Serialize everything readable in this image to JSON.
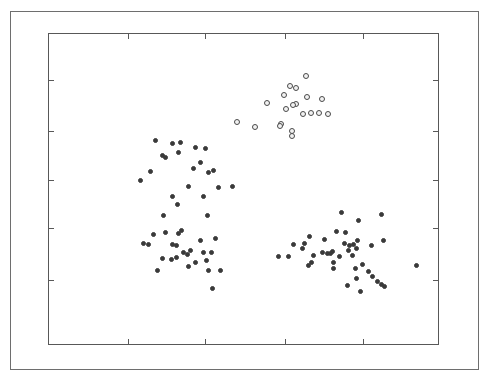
{
  "figure": {
    "width": 490,
    "height": 382,
    "background": "#ffffff",
    "outer_border": {
      "x": 10,
      "y": 11,
      "width": 469,
      "height": 359,
      "color": "#6e6e6e"
    },
    "plot_box": {
      "x": 48,
      "y": 33,
      "width": 391,
      "height": 312,
      "color": "#585858"
    }
  },
  "chart_data": {
    "type": "scatter",
    "title": "",
    "xlabel": "",
    "ylabel": "",
    "grid": false,
    "legend": "none",
    "xlim": [
      0,
      1
    ],
    "ylim": [
      0,
      1
    ],
    "xtick_labels": [],
    "ytick_labels": [],
    "tick_direction": "in",
    "xticks_px": [
      128,
      205,
      285,
      363
    ],
    "yticks_px": [
      80,
      131,
      180,
      228,
      280
    ],
    "marker_colors": {
      "filled": "#3a3a3a",
      "open_edge": "#4a4a4a",
      "open_face": "#f2f2f2"
    },
    "series": [
      {
        "name": "cluster-upper-left",
        "marker": "filled",
        "points_px": [
          [
            155,
            140
          ],
          [
            172,
            143
          ],
          [
            180,
            142
          ],
          [
            162,
            155
          ],
          [
            165,
            157
          ],
          [
            140,
            180
          ],
          [
            178,
            152
          ],
          [
            195,
            147
          ],
          [
            205,
            148
          ],
          [
            200,
            162
          ],
          [
            208,
            172
          ],
          [
            213,
            170
          ],
          [
            188,
            186
          ],
          [
            218,
            187
          ],
          [
            203,
            196
          ],
          [
            172,
            196
          ],
          [
            177,
            204
          ],
          [
            207,
            215
          ],
          [
            163,
            215
          ],
          [
            232,
            186
          ],
          [
            150,
            171
          ],
          [
            193,
            168
          ]
        ]
      },
      {
        "name": "cluster-upper-middle-open",
        "marker": "open",
        "points_px": [
          [
            306,
            76
          ],
          [
            290,
            86
          ],
          [
            296,
            88
          ],
          [
            284,
            95
          ],
          [
            307,
            97
          ],
          [
            296,
            104
          ],
          [
            293,
            105
          ],
          [
            286,
            109
          ],
          [
            322,
            99
          ],
          [
            303,
            114
          ],
          [
            311,
            113
          ],
          [
            319,
            113
          ],
          [
            328,
            114
          ],
          [
            267,
            103
          ],
          [
            237,
            122
          ],
          [
            281,
            124
          ],
          [
            280,
            126
          ],
          [
            292,
            131
          ],
          [
            292,
            136
          ],
          [
            255,
            127
          ]
        ]
      },
      {
        "name": "cluster-lower-left",
        "marker": "filled",
        "points_px": [
          [
            153,
            234
          ],
          [
            143,
            243
          ],
          [
            148,
            244
          ],
          [
            165,
            232
          ],
          [
            178,
            233
          ],
          [
            181,
            230
          ],
          [
            172,
            244
          ],
          [
            176,
            245
          ],
          [
            183,
            252
          ],
          [
            187,
            254
          ],
          [
            190,
            250
          ],
          [
            162,
            258
          ],
          [
            171,
            259
          ],
          [
            176,
            257
          ],
          [
            203,
            252
          ],
          [
            211,
            252
          ],
          [
            200,
            240
          ],
          [
            215,
            238
          ],
          [
            208,
            270
          ],
          [
            220,
            270
          ],
          [
            212,
            288
          ],
          [
            206,
            260
          ],
          [
            195,
            262
          ],
          [
            157,
            270
          ],
          [
            188,
            266
          ]
        ]
      },
      {
        "name": "cluster-lower-right",
        "marker": "filled",
        "points_px": [
          [
            341,
            212
          ],
          [
            358,
            220
          ],
          [
            381,
            214
          ],
          [
            345,
            232
          ],
          [
            357,
            240
          ],
          [
            336,
            231
          ],
          [
            344,
            243
          ],
          [
            349,
            245
          ],
          [
            353,
            244
          ],
          [
            356,
            248
          ],
          [
            293,
            244
          ],
          [
            302,
            248
          ],
          [
            304,
            243
          ],
          [
            322,
            252
          ],
          [
            327,
            253
          ],
          [
            332,
            251
          ],
          [
            339,
            256
          ],
          [
            309,
            236
          ],
          [
            313,
            255
          ],
          [
            324,
            239
          ],
          [
            371,
            245
          ],
          [
            383,
            240
          ],
          [
            333,
            268
          ],
          [
            355,
            268
          ],
          [
            362,
            264
          ],
          [
            368,
            271
          ],
          [
            372,
            276
          ],
          [
            377,
            281
          ],
          [
            381,
            284
          ],
          [
            384,
            286
          ],
          [
            356,
            278
          ],
          [
            347,
            285
          ],
          [
            360,
            291
          ],
          [
            330,
            253
          ],
          [
            333,
            262
          ],
          [
            278,
            256
          ],
          [
            308,
            265
          ],
          [
            311,
            262
          ],
          [
            288,
            256
          ],
          [
            416,
            265
          ],
          [
            352,
            255
          ],
          [
            348,
            250
          ]
        ]
      }
    ]
  }
}
